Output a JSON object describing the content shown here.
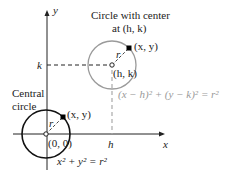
{
  "title": "Circle with center at (h, k)",
  "labels": {
    "y_axis": "y",
    "x_axis": "x",
    "k_tick": "k",
    "h_tick": "h",
    "big_title_line1": "Circle with center",
    "big_title_line2": "at (h, k)",
    "big_point": "(x, y)",
    "big_radius": "r",
    "big_center": "(h, k)",
    "big_equation": "(x − h)² + (y − k)² = r²",
    "central_line1": "Central",
    "central_line2": "circle",
    "small_point": "(x, y)",
    "small_radius": "r",
    "small_center": "(0, 0)",
    "small_equation": "x² + y² = r²"
  },
  "colors": {
    "axes": "#222222",
    "central_circle": "#111111",
    "shifted_circle": "#9a9a9a",
    "equation_gray": "#9a9a9a"
  }
}
